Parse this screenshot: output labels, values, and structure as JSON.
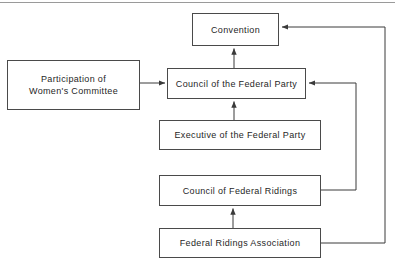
{
  "diagram": {
    "line_color": "#4a4a4a",
    "background_color": "#ffffff",
    "text_color": "#1f1f1f",
    "top_rule": "horizontal-rule",
    "nodes": [
      {
        "id": "convention",
        "label": "Convention"
      },
      {
        "id": "council_fp",
        "label": "Council of the Federal Party"
      },
      {
        "id": "participation",
        "label": "Participation of\nWomen's Committee"
      },
      {
        "id": "executive",
        "label": "Executive of the Federal Party"
      },
      {
        "id": "council_fr",
        "label": "Council of Federal Ridings"
      },
      {
        "id": "fra",
        "label": "Federal Ridings Association"
      }
    ],
    "edges": [
      {
        "id": "edge-council-fp-to-convention",
        "from": "council_fp",
        "to": "convention",
        "style": "vertical-arrow-up"
      },
      {
        "id": "edge-participation-to-council",
        "from": "participation",
        "to": "council_fp",
        "style": "horizontal-arrow-right"
      },
      {
        "id": "edge-executive-to-council",
        "from": "executive",
        "to": "council_fp",
        "style": "vertical-arrow-up"
      },
      {
        "id": "edge-fra-to-council-fr",
        "from": "fra",
        "to": "council_fr",
        "style": "vertical-arrow-up"
      },
      {
        "id": "edge-council-fr-to-council-fp",
        "from": "council_fr",
        "to": "council_fp",
        "style": "right-routed-arrow"
      },
      {
        "id": "edge-fra-to-convention",
        "from": "fra",
        "to": "convention",
        "style": "outer-right-routed-arrow"
      }
    ]
  }
}
